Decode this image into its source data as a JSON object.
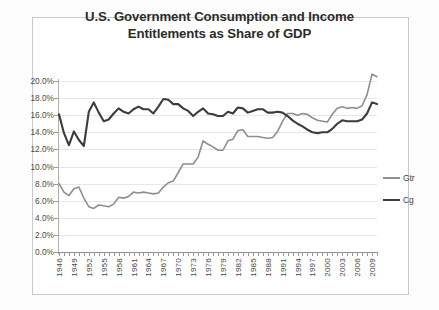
{
  "chart_data": {
    "type": "line",
    "title": "U.S. Government Consumption and Income Entitlements as Share of GDP",
    "title_line1": "U.S. Government Consumption and Income",
    "title_line2": "Entitlements as Share of GDP",
    "xlabel": "",
    "ylabel": "",
    "ylim": [
      0,
      20
    ],
    "ytick_labels": [
      "20.0%",
      "18.0%",
      "16.0%",
      "14.0%",
      "12.0%",
      "10.0%",
      "8.0%",
      "6.0%",
      "4.0%",
      "2.0%",
      "0.0%"
    ],
    "ytick_values": [
      20,
      18,
      16,
      14,
      12,
      10,
      8,
      6,
      4,
      2,
      0
    ],
    "grid": true,
    "legend_position": "right",
    "x": [
      1946,
      1947,
      1948,
      1949,
      1950,
      1951,
      1952,
      1953,
      1954,
      1955,
      1956,
      1957,
      1958,
      1959,
      1960,
      1961,
      1962,
      1963,
      1964,
      1965,
      1966,
      1967,
      1968,
      1969,
      1970,
      1971,
      1972,
      1973,
      1974,
      1975,
      1976,
      1977,
      1978,
      1979,
      1980,
      1981,
      1982,
      1983,
      1984,
      1985,
      1986,
      1987,
      1988,
      1989,
      1990,
      1991,
      1992,
      1993,
      1994,
      1995,
      1996,
      1997,
      1998,
      1999,
      2000,
      2001,
      2002,
      2003,
      2004,
      2005,
      2006,
      2007,
      2008,
      2009,
      2010
    ],
    "xtick_labels": [
      "1946",
      "1949",
      "1952",
      "1955",
      "1958",
      "1961",
      "1964",
      "1967",
      "1970",
      "1973",
      "1976",
      "1979",
      "1982",
      "1985",
      "1988",
      "1991",
      "1994",
      "1997",
      "2000",
      "2003",
      "2006",
      "2009"
    ],
    "series": [
      {
        "name": "Gtr",
        "color": "#8f8f8f",
        "values": [
          8.0,
          7.0,
          6.6,
          7.4,
          7.6,
          6.3,
          5.3,
          5.1,
          5.5,
          5.4,
          5.3,
          5.6,
          6.4,
          6.3,
          6.5,
          7.0,
          6.9,
          7.0,
          6.9,
          6.8,
          6.9,
          7.6,
          8.1,
          8.3,
          9.3,
          10.3,
          10.3,
          10.3,
          11.1,
          13.0,
          12.6,
          12.3,
          11.9,
          11.9,
          13.0,
          13.2,
          14.2,
          14.3,
          13.5,
          13.5,
          13.5,
          13.4,
          13.3,
          13.4,
          14.1,
          15.3,
          16.2,
          16.2,
          16.0,
          16.2,
          16.1,
          15.7,
          15.4,
          15.3,
          15.2,
          16.1,
          16.8,
          17.0,
          16.8,
          16.9,
          16.8,
          17.1,
          18.4,
          20.8,
          20.5
        ]
      },
      {
        "name": "Cg",
        "color": "#3c3c3c",
        "values": [
          16.1,
          13.9,
          12.5,
          14.1,
          13.1,
          12.4,
          16.4,
          17.5,
          16.3,
          15.3,
          15.5,
          16.2,
          16.8,
          16.4,
          16.2,
          16.7,
          17.0,
          16.7,
          16.7,
          16.2,
          17.0,
          17.9,
          17.8,
          17.3,
          17.3,
          16.8,
          16.5,
          15.9,
          16.4,
          16.8,
          16.2,
          16.1,
          15.9,
          15.9,
          16.4,
          16.2,
          16.9,
          16.8,
          16.3,
          16.5,
          16.7,
          16.7,
          16.3,
          16.3,
          16.4,
          16.3,
          15.9,
          15.4,
          15.0,
          14.7,
          14.3,
          14.0,
          13.9,
          14.0,
          14.0,
          14.4,
          15.0,
          15.4,
          15.3,
          15.3,
          15.3,
          15.5,
          16.2,
          17.5,
          17.3
        ]
      }
    ]
  },
  "legend": {
    "items": [
      {
        "label": "Gtr",
        "color": "#8f8f8f"
      },
      {
        "label": "Cg",
        "color": "#3c3c3c"
      }
    ]
  }
}
